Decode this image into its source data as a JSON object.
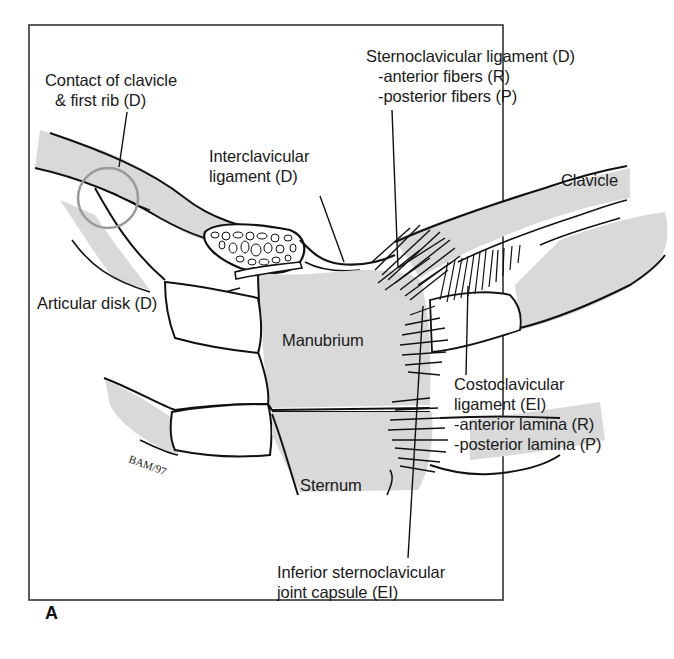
{
  "figure": {
    "panel_letter": "A",
    "signature": "BAM 1997",
    "colors": {
      "bone_fill": "#d9d9d9",
      "outline": "#111111",
      "border": "#333333",
      "highlight_circle": "#9a9a9a",
      "background": "#ffffff"
    },
    "labels": {
      "contact": [
        "Contact of clavicle",
        "& first rib (D)"
      ],
      "interclavicular": [
        "Interclavicular",
        "ligament (D)"
      ],
      "sternoclavicular": [
        "Sternoclavicular ligament (D)",
        "-anterior fibers (R)",
        "-posterior fibers (P)"
      ],
      "clavicle": "Clavicle",
      "articular_disk": "Articular disk (D)",
      "manubrium": "Manubrium",
      "costoclavicular": [
        "Costoclavicular",
        "ligament (EI)",
        "-anterior lamina (R)",
        "-posterior lamina (P)"
      ],
      "sternum": "Sternum",
      "inferior_capsule": [
        "Inferior sternoclavicular",
        "joint capsule (EI)"
      ]
    }
  }
}
